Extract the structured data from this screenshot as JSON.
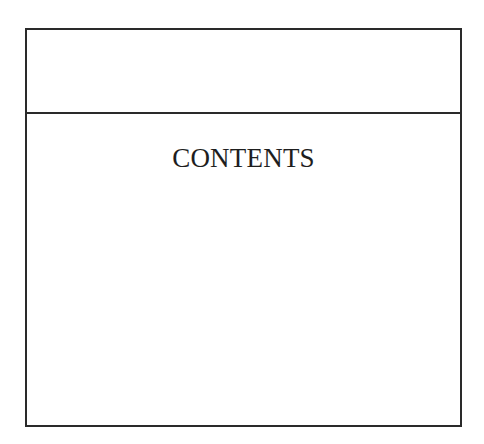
{
  "page": {
    "header_box": {
      "text": ""
    },
    "contents": {
      "title": "CONTENTS",
      "entries": []
    }
  },
  "colors": {
    "border": "#2a2a2a",
    "text": "#1e1e1e",
    "background": "#ffffff"
  }
}
